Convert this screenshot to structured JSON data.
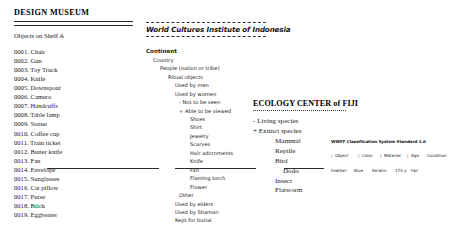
{
  "design_museum": {
    "title": "DESIGN MUSEUM",
    "subtitle": "Objects on Shelf A",
    "items": [
      "0001. Chair",
      "0002. Gun",
      "0003. Toy Truck",
      "0004. Knife",
      "0005. Downspout",
      "0006. Camera",
      "0007. Handcuffs",
      "0008. Table lamp",
      "0009. Statue",
      "0010. Coffee cup",
      "0011. Train ticket",
      "0012. Butter knife",
      "0013. Fan",
      "0014. Envelope",
      "0015. Sunglasses",
      "0016. Cat pillow",
      "0017. Purse",
      "0018. Brick",
      "0019. Eggbeater"
    ]
  },
  "world_cultures": {
    "title": "World Cultures Institute of Indonesia",
    "tree": [
      {
        "label": "Continent",
        "level": 0
      },
      {
        "label": "Country",
        "level": 1
      },
      {
        "label": "People (nation or tribe)",
        "level": 2
      },
      {
        "label": "Ritual objects",
        "level": 3
      },
      {
        "label": "Used by men",
        "level": 4
      },
      {
        "label": "Used by women",
        "level": 4
      },
      {
        "label": "- Not to be seen",
        "level": 5
      },
      {
        "label": "+ Able to be viewed",
        "level": 5
      },
      {
        "label": "Shoes",
        "level": 6
      },
      {
        "label": "Shirt",
        "level": 6
      },
      {
        "label": "Jewelry",
        "level": 6
      },
      {
        "label": "Scarves",
        "level": 6
      },
      {
        "label": "Hair adornments",
        "level": 6
      },
      {
        "label": "Knife",
        "level": 6
      },
      {
        "label": "Fan",
        "level": 6
      },
      {
        "label": "Flaming torch",
        "level": 6
      },
      {
        "label": "Flower",
        "level": 6
      },
      {
        "label": "Other",
        "level": 5
      },
      {
        "label": "Used by elders",
        "level": 4
      },
      {
        "label": "Used by Shaman",
        "level": 4
      },
      {
        "label": "Kept for burial",
        "level": 4
      }
    ]
  },
  "ecology_center": {
    "title": "ECOLOGY CENTER of FIJI",
    "tree": [
      {
        "label": "- Living species",
        "level": 0
      },
      {
        "label": "+ Extinct species",
        "level": 0
      },
      {
        "label": "Mammal",
        "level": 1
      },
      {
        "label": "Reptile",
        "level": 1
      },
      {
        "label": "Bird",
        "level": 1
      },
      {
        "label": "Dodo",
        "level": 2
      },
      {
        "label": "Insect",
        "level": 1
      },
      {
        "label": "Flatworm",
        "level": 1
      }
    ]
  },
  "wwff_table": {
    "title": "WWFF Classification System Standard 1.0",
    "columns": [
      "Object",
      "Color",
      "Material",
      "Age",
      "Condition"
    ],
    "separator": "|",
    "rows": [
      [
        "Feather",
        "Blue",
        "Keratin",
        "175 y",
        "Fair"
      ]
    ]
  }
}
